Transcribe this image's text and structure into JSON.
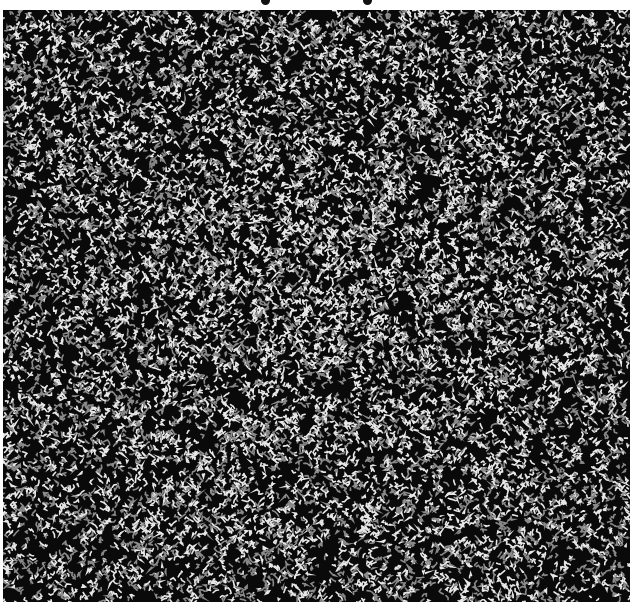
{
  "image": {
    "description": "Random-dot squiggle autostereogram with two focusing guide dots at top",
    "guide_dots": [
      {
        "x": 265,
        "y": 0
      },
      {
        "x": 367,
        "y": 0
      }
    ],
    "pattern_region": {
      "x": 3,
      "y": 10,
      "width": 627,
      "height": 592
    },
    "colors": {
      "background": "#ffffff",
      "dark": "#0a0a0a",
      "light": "#e8e8e8",
      "mid": "#8a8a8a"
    },
    "texture": {
      "seed": 7331,
      "cell": 2,
      "center_brightness_boost": 0.18
    }
  }
}
